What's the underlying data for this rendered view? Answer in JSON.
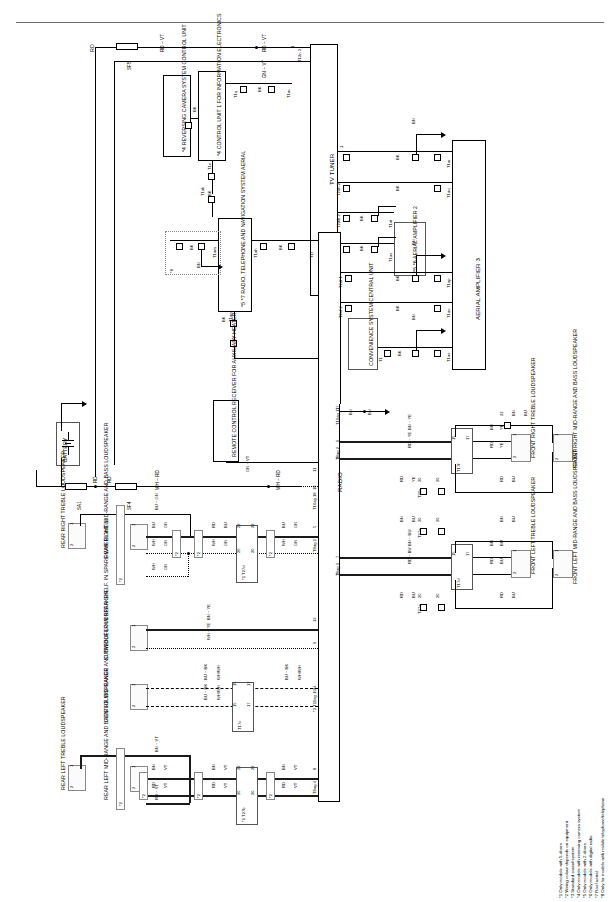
{
  "diagram": {
    "sheet_width": 616,
    "sheet_height": 902
  },
  "components": {
    "battery": "BATTERY",
    "reversing_camera": "*4 REVERSING CAMERA SYSTEM CONTROL UNIT",
    "control_unit_info": "*4 CONTROL UNIT 1 FOR INFORMATION ELECTRONICS",
    "radio_tel_nav_aerial": "*5 *7 RADIO, TELEPHONE AND NAVIGATION SYSTEM AERIAL",
    "remote_control_receiver": "REMOTE CONTROL RECEIVER FOR AUXILIARY HEATER",
    "tv_tuner": "TV TUNER",
    "aerial_amplifier_2": "*5 *6 AERIAL AMPLIFIER 2",
    "aerial_amplifier_3": "AERIAL AMPLIFIER 3",
    "convenience_unit": "CONVENIENCE SYSTEM CENTRAL UNIT",
    "radio": "RADIO",
    "rear_right_treble": "REAR RIGHT TREBLE LOUDSPEAKER",
    "rear_right_mid": "REAR RIGHT MID-RANGE AND BASS LOUDSPEAKER",
    "subwoofer": "SUBWOOFER IN REAR SHELF. IN SPARE WHEEL WELL",
    "centre_mid": "CENTRE MID-RANGE ANC TREBLE LOUDSPEAKER",
    "rear_left_treble": "REAR LEFT TREBLE LOUDSPEAKER",
    "rear_left_mid": "REAR LEFT MID-RANGE AND BASS LOUDSPEAKER",
    "front_right_treble": "FRONT RIGHT TREBLE LOUDSPEAKER",
    "front_right_mid": "FRONT RIGHT MID-RANGE AND BASS LOUDSPEAKER",
    "front_left_treble": "FRONT LEFT TREBLE LOUDSPEAKER",
    "front_left_mid": "FRONT LEFT MID-RANGE AND BASS LOUDSPEAKER"
  },
  "fuses": {
    "sf5": "SF5",
    "sa1": "SA1",
    "sf4": "SF4"
  },
  "wire_colours": {
    "rd": "RD",
    "vt": "VT",
    "gn": "GN",
    "bk": "BK",
    "bn": "BN",
    "bu": "BU",
    "wh": "WH",
    "ye": "YE"
  },
  "wire_labels": {
    "rd_vt_top": "RD ~ VT",
    "rd_vt_top2": "RD ~ VT",
    "gn_vt_top": "GN ~ VT",
    "bk1": "BK",
    "bk2": "BK",
    "bk3": "BK",
    "bk4": "BK",
    "bk5": "BK",
    "bk6": "BK",
    "bk7": "BK",
    "bk8": "BK",
    "bk9": "BK",
    "bn1": "BN",
    "bn2": "BN",
    "bn3": "BN",
    "bn4": "BN",
    "bn5": "BN",
    "gn_vt_rcr": "GN ~ VT",
    "wh_rd_1": "WH ~ RD",
    "wh_rd_2": "WH ~ RD",
    "bu_gn_1": "BU ~ GN",
    "bu_gn_2": "BU ~ GN",
    "bu_gn_3": "BU ~ GN",
    "wh_gn_1": "WH ~ GN",
    "wh_gn_2": "WH ~ GN",
    "wh_gn_3": "WH ~ GN",
    "rd_bu_1": "RD ~ BU",
    "bn_ye_1": "BN ~ YE",
    "wh_ye_1": "WH ~ YE",
    "bu_bk_1": "BU ~ BK",
    "wh_wh_1": "WH/WH",
    "bu_bk_2": "BU ~ BK",
    "wh_wh_2": "WH/WH",
    "bn_vt_1": "BN ~ VT",
    "bn_vt_2": "BN ~ VT",
    "bn_vt_3": "BN ~ VT",
    "rd_vt_1": "RD ~ VT",
    "rd_vt_2": "RD ~ VT",
    "rd_vt_3": "RD ~ VT",
    "rd_vt_4": "RD ~ VT",
    "bn_ye_r": "BN ~ YE",
    "rd_ye_r": "RD ~ YE",
    "bn_bu_r": "BN ~ BU",
    "rd_bu_r": "RD ~ BU",
    "bn_bu_fl": "BN ~ BU",
    "rd_bu_fl": "RD ~ BU",
    "bn_ye_fr": "BN ~ YE",
    "rd_ye_fr": "RD ~ YE"
  },
  "terminals": {
    "t1q": "T1q",
    "t1m": "T1m",
    "t12n3": "T12n 3",
    "t1n": "T1n",
    "t1ak": "T1ak",
    "t1am": "T1am",
    "t1ah": "T1ah",
    "t1ag": "T1ag",
    "t1l": "T1l",
    "t2dh2": "T2dh 2",
    "t2wb2": "T2wb 2",
    "t1i2": "T1i 2",
    "t2df1": "T2df 1",
    "t2ef2": "T2ef 2",
    "t1": "T1",
    "t1ar": "T1ar",
    "t1aq": "T1aq",
    "t1at": "T1at",
    "t1as": "T1as",
    "t1ap": "T1ap",
    "t1ao": "T1ao",
    "t1ae": "T1ae",
    "t10ag18": "T10ag 18",
    "t10ag17": "T10ag 17",
    "t8ag1": "T8ag 1",
    "t8ag2": "T8ag 2",
    "t8ag3": "T8ag 3",
    "t8ag4": "T8ag 4",
    "t10ag10": "*3 T10ag 10",
    "t17c": "T17c",
    "t17d": "T17d",
    "t17f": "T17f",
    "t27a": "T27a",
    "t27b": "*1 T27b",
    "t27d": "*1 T27d",
    "t20c": "T20c"
  },
  "pin_numbers": {
    "p1": "1",
    "p2": "2",
    "p5": "5",
    "p6": "6",
    "p7": "7",
    "p8": "8",
    "p9": "9",
    "p11": "11",
    "p13": "13",
    "p14": "14",
    "p15": "15",
    "p17": "17",
    "p18": "18",
    "p20": "20",
    "p22": "22"
  },
  "footnotes": [
    "*1 Only models with 5-doors",
    "*2 Wiring colour depends on equipment",
    "*3 Standard sound system",
    "*4 Only models with reversing camera system",
    "*5 Only models with 2-doors",
    "*6 Only models with digital radio",
    "*7 Roof aerial",
    "*8 Only for models with mobile telephone/telephone"
  ],
  "marks": {
    "m2a": "*2",
    "m2b": "*2",
    "m2c": "*2",
    "m2d": "*2",
    "m2e": "*2",
    "m2f": "*2",
    "m8": "*8",
    "m4a": "*4",
    "m4b": "*4",
    "m5": "*5",
    "m7": "*7",
    "m56": "*5 *6",
    "m3": "*3"
  }
}
